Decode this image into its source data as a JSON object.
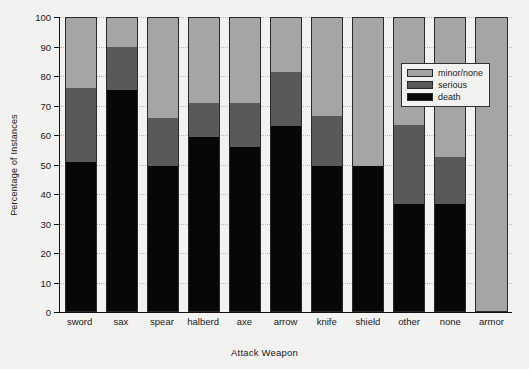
{
  "chart_data": {
    "type": "bar",
    "stacked": true,
    "title": "",
    "xlabel": "Attack Weapon",
    "ylabel": "Percentage of Instances",
    "ylim": [
      0,
      100
    ],
    "yticks": [
      0,
      10,
      20,
      30,
      40,
      50,
      60,
      70,
      80,
      90,
      100
    ],
    "grid": true,
    "legend_position": "upper right",
    "categories": [
      "sword",
      "sax",
      "spear",
      "halberd",
      "axe",
      "arrow",
      "knife",
      "shield",
      "other",
      "none",
      "armor"
    ],
    "series": [
      {
        "name": "death",
        "color": "#070707",
        "values": [
          51.0,
          75.5,
          49.5,
          59.5,
          56.0,
          63.0,
          49.5,
          49.5,
          36.5,
          36.5,
          0.0
        ]
      },
      {
        "name": "serious",
        "color": "#595959",
        "values": [
          25.0,
          14.5,
          16.5,
          11.5,
          15.0,
          18.5,
          17.0,
          0.0,
          27.0,
          16.0,
          0.0
        ]
      },
      {
        "name": "minor/none",
        "color": "#a5a5a5",
        "values": [
          24.0,
          10.0,
          34.0,
          29.0,
          29.0,
          18.5,
          33.5,
          50.5,
          36.5,
          47.5,
          100.0
        ]
      }
    ]
  },
  "legend": {
    "entries": [
      {
        "label": "minor/none",
        "color": "#a5a5a5"
      },
      {
        "label": "serious",
        "color": "#595959"
      },
      {
        "label": "death",
        "color": "#070707"
      }
    ]
  }
}
